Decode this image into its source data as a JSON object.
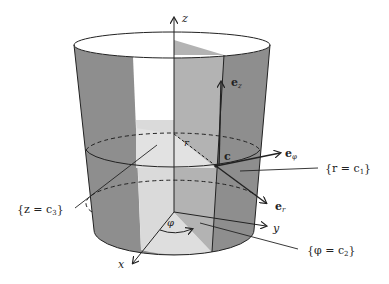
{
  "figure": {
    "axes": {
      "z_label": "z",
      "y_label": "y",
      "x_label": "x"
    },
    "vectors": {
      "e_z": "e",
      "e_z_sub": "z",
      "e_phi": "e",
      "e_phi_sub": "φ",
      "e_r": "e",
      "e_r_sub": "r"
    },
    "point_label": "c",
    "radius_label": "r",
    "angle_label": "φ",
    "surfaces": {
      "r": "{r = c",
      "r_sub": "1",
      "r_close": "}",
      "z": "{z = c",
      "z_sub": "3",
      "z_close": "}",
      "phi": "{φ = c",
      "phi_sub": "2",
      "phi_close": "}"
    },
    "colors": {
      "dark_gray": "#8c8c8c",
      "mid_gray": "#b4b4b4",
      "light_gray": "#dcdcdc",
      "line": "#222222"
    }
  }
}
